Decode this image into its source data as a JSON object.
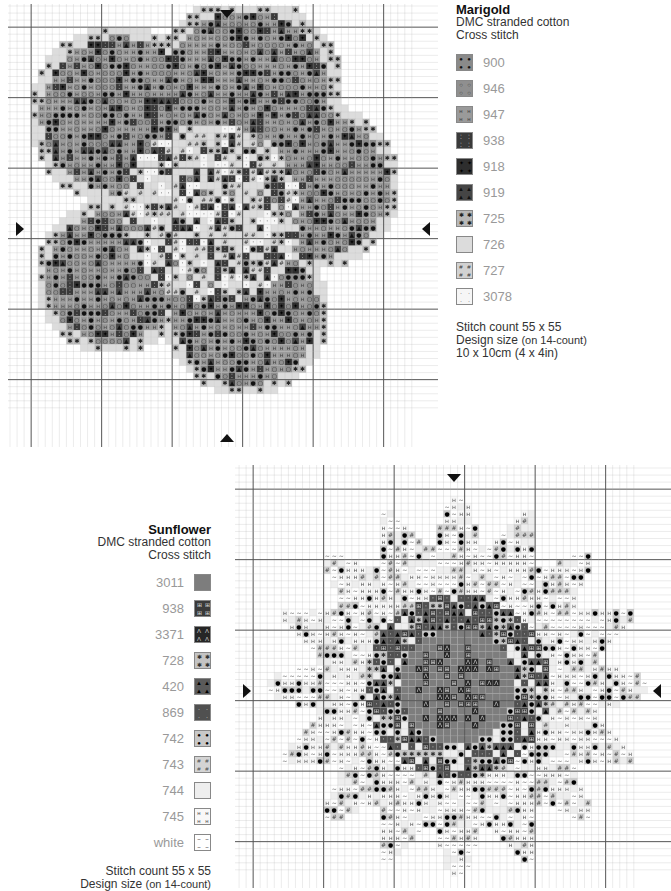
{
  "marigold": {
    "title": "Marigold",
    "thread": "DMC stranded cotton",
    "stitch_type": "Cross stitch",
    "legend": [
      {
        "code": "900",
        "bg": "#8a8a8a",
        "fg": "#111111",
        "symbol": "●"
      },
      {
        "code": "946",
        "bg": "#8f8f8f",
        "fg": "#333333",
        "symbol": "○"
      },
      {
        "code": "947",
        "bg": "#9a9a9a",
        "fg": "#444444",
        "symbol": "н"
      },
      {
        "code": "938",
        "bg": "#3a3a3a",
        "fg": "#dddddd",
        "symbol": "⁚"
      },
      {
        "code": "918",
        "bg": "#2e2e2e",
        "fg": "#000000",
        "symbol": "✦"
      },
      {
        "code": "919",
        "bg": "#454545",
        "fg": "#111111",
        "symbol": "▲"
      },
      {
        "code": "725",
        "bg": "#b8b8b8",
        "fg": "#222222",
        "symbol": "✱"
      },
      {
        "code": "726",
        "bg": "#dcdcdc",
        "fg": "#dcdcdc",
        "symbol": ""
      },
      {
        "code": "727",
        "bg": "#d2d2d2",
        "fg": "#333333",
        "symbol": "#"
      },
      {
        "code": "3078",
        "bg": "#f6f6f6",
        "fg": "#222222",
        "symbol": "·"
      }
    ],
    "stitch_count": "Stitch count 55 x 55",
    "design_size_label": "Design size",
    "design_size_note": "(on 14-count)",
    "dimensions": "10 x 10cm (4 x 4in)",
    "grid_cells": 55,
    "center_markers": [
      "top",
      "bottom",
      "left",
      "right"
    ]
  },
  "sunflower": {
    "title": "Sunflower",
    "thread": "DMC stranded cotton",
    "stitch_type": "Cross stitch",
    "legend": [
      {
        "code": "3011",
        "bg": "#7d7d7d",
        "fg": "#7d7d7d",
        "symbol": ""
      },
      {
        "code": "938",
        "bg": "#3a3a3a",
        "fg": "#dddddd",
        "symbol": "⊞"
      },
      {
        "code": "3371",
        "bg": "#262626",
        "fg": "#cccccc",
        "symbol": "Λ"
      },
      {
        "code": "728",
        "bg": "#c4c4c4",
        "fg": "#333333",
        "symbol": "✱"
      },
      {
        "code": "420",
        "bg": "#5a5a5a",
        "fg": "#000000",
        "symbol": "▲"
      },
      {
        "code": "869",
        "bg": "#505050",
        "fg": "#eeeeee",
        "symbol": "·"
      },
      {
        "code": "742",
        "bg": "#c8c8c8",
        "fg": "#000000",
        "symbol": "●"
      },
      {
        "code": "743",
        "bg": "#d4d4d4",
        "fg": "#444444",
        "symbol": "#"
      },
      {
        "code": "744",
        "bg": "#eeeeee",
        "fg": "#eeeeee",
        "symbol": ""
      },
      {
        "code": "745",
        "bg": "#f8f8f8",
        "fg": "#555555",
        "symbol": "н"
      },
      {
        "code": "white",
        "bg": "#ffffff",
        "fg": "#555555",
        "symbol": "~"
      }
    ],
    "stitch_count": "Stitch count 55 x 55",
    "design_size_label": "Design size",
    "design_size_note": "(on 14-count)",
    "grid_cells": 55,
    "center_markers": [
      "top",
      "left",
      "right"
    ]
  }
}
